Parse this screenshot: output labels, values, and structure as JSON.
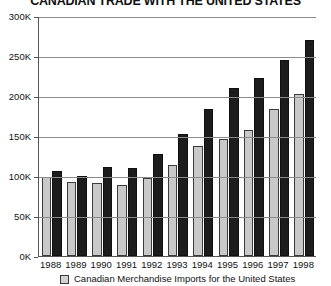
{
  "chart_data": {
    "type": "bar",
    "title": "CANADIAN TRADE WITH THE UNITED STATES",
    "xlabel": "",
    "ylabel": "",
    "categories": [
      "1988",
      "1989",
      "1990",
      "1991",
      "1992",
      "1993",
      "1994",
      "1995",
      "1996",
      "1997",
      "1998"
    ],
    "series": [
      {
        "name": "Canadian Merchandise Imports for the United States",
        "color": "#c9c9c9",
        "values": [
          99000,
          93000,
          91000,
          89000,
          98000,
          114000,
          138000,
          146000,
          158000,
          184000,
          203000
        ]
      },
      {
        "name": "Canadian Merchandise Exports to the United States",
        "color": "#1c1c1c",
        "values": [
          106000,
          100000,
          111000,
          110000,
          127000,
          152000,
          184000,
          210000,
          223000,
          245000,
          270000
        ]
      }
    ],
    "ylim": [
      0,
      300000
    ],
    "ytick_labels": [
      "300K",
      "250K",
      "200K",
      "150K",
      "100K",
      "50K",
      "0K"
    ],
    "ytick_values": [
      300000,
      250000,
      200000,
      150000,
      100000,
      50000,
      0
    ],
    "grid": true,
    "grid_axis": "y",
    "legend_position": "bottom",
    "legend_entries": [
      {
        "label": "Canadian Merchandise Imports for the United States",
        "swatch_color": "#d2d2d2"
      }
    ]
  }
}
